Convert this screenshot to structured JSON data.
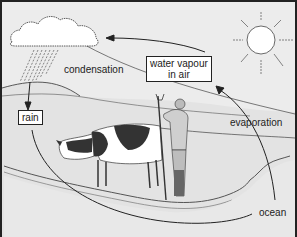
{
  "diagram": {
    "labels": {
      "condensation": "condensation",
      "water_vapour_line1": "water vapour",
      "water_vapour_line2": "in air",
      "rain": "rain",
      "evaporation": "evaporation",
      "ocean": "ocean"
    },
    "elements": [
      "cloud-icon",
      "rain-streaks",
      "sun-icon",
      "cow-illustration",
      "farmer-illustration",
      "hills",
      "ocean-shoreline",
      "arrows"
    ],
    "colors": {
      "background": "#ececec",
      "line": "#222222",
      "box_fill": "#ffffff"
    }
  }
}
